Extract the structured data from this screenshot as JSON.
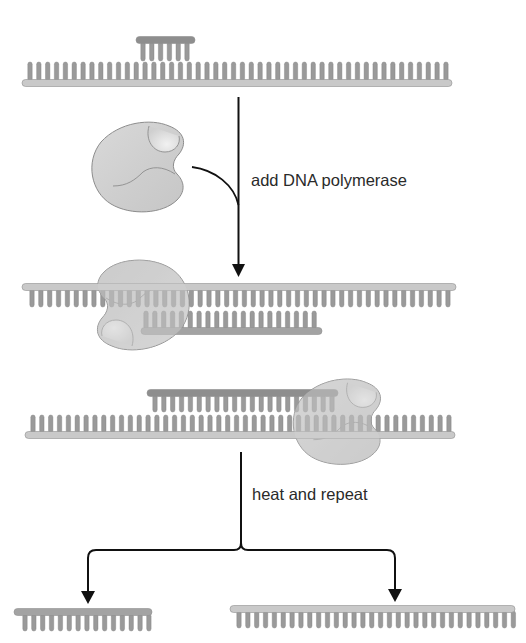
{
  "labels": {
    "step1": "add DNA polymerase",
    "step2": "heat and repeat"
  },
  "colors": {
    "background": "#ffffff",
    "template_backbone": "#c9c9c9",
    "template_backbone_edge": "#8f8f8f",
    "base_tooth": "#9a9a9a",
    "primer_backbone": "#8e8e8e",
    "new_strand_backbone": "#a3a3a3",
    "polymerase_fill": "#d2d2d2",
    "polymerase_edge": "#8c8c8c",
    "arrow": "#111111",
    "text": "#2a2a2a"
  },
  "diagram": {
    "nodes": [
      {
        "id": "template_with_primer",
        "description": "single-stranded template with short primer annealed"
      },
      {
        "id": "polymerase_free",
        "description": "DNA polymerase enzyme"
      },
      {
        "id": "extension_early",
        "description": "polymerase bound, new strand partially extended"
      },
      {
        "id": "extension_late",
        "description": "polymerase further along, new strand longer"
      },
      {
        "id": "product_short",
        "description": "short single strand product"
      },
      {
        "id": "product_long",
        "description": "long single strand template"
      }
    ],
    "edges": [
      {
        "from": "template_with_primer",
        "to": "extension_early",
        "label": "add DNA polymerase"
      },
      {
        "from": "polymerase_free",
        "to": "extension_early",
        "label": ""
      },
      {
        "from": "extension_late",
        "to": "product_short",
        "label": "heat and repeat"
      },
      {
        "from": "extension_late",
        "to": "product_long",
        "label": "heat and repeat"
      }
    ]
  },
  "strands": [
    {
      "name": "top-template",
      "x1": 22,
      "x2": 452,
      "y": 83,
      "teeth": "up",
      "tooth_start": 30,
      "tooth_count": 48,
      "tooth_gap": 8.85,
      "tooth_len": 19,
      "color": "template_backbone"
    },
    {
      "name": "top-primer",
      "x1": 136,
      "x2": 195,
      "y": 40,
      "teeth": "down",
      "tooth_start": 143,
      "tooth_count": 6,
      "tooth_gap": 8.8,
      "tooth_len": 19,
      "color": "primer_backbone"
    },
    {
      "name": "mid1-template",
      "x1": 22,
      "x2": 456,
      "y": 287,
      "teeth": "down",
      "tooth_start": 32,
      "tooth_count": 48,
      "tooth_gap": 8.85,
      "tooth_len": 18,
      "color": "template_backbone"
    },
    {
      "name": "mid1-new",
      "x1": 141,
      "x2": 322,
      "y": 331,
      "teeth": "up",
      "tooth_start": 146,
      "tooth_count": 20,
      "tooth_gap": 8.85,
      "tooth_len": 18,
      "color": "new_strand_backbone"
    },
    {
      "name": "mid2-new",
      "x1": 147,
      "x2": 338,
      "y": 393,
      "teeth": "down",
      "tooth_start": 155,
      "tooth_count": 21,
      "tooth_gap": 8.85,
      "tooth_len": 17,
      "color": "primer_backbone"
    },
    {
      "name": "mid2-template",
      "x1": 25,
      "x2": 455,
      "y": 435,
      "teeth": "up",
      "tooth_start": 33,
      "tooth_count": 48,
      "tooth_gap": 8.85,
      "tooth_len": 18,
      "color": "template_backbone"
    },
    {
      "name": "bottom-left-product",
      "x1": 14,
      "x2": 152,
      "y": 612,
      "teeth": "down",
      "tooth_start": 25,
      "tooth_count": 15,
      "tooth_gap": 8.85,
      "tooth_len": 17,
      "color": "new_strand_backbone"
    },
    {
      "name": "bottom-right-product",
      "x1": 230,
      "x2": 515,
      "y": 609,
      "teeth": "down",
      "tooth_start": 239,
      "tooth_count": 32,
      "tooth_gap": 8.85,
      "tooth_len": 17,
      "color": "template_backbone"
    }
  ]
}
